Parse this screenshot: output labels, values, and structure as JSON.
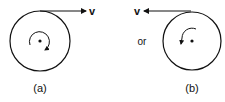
{
  "diagram": {
    "figure_a": {
      "label": "(a)",
      "velocity_label": "v",
      "velocity_direction": "right",
      "rotation": "clockwise"
    },
    "connector": "or",
    "figure_b": {
      "label": "(b)",
      "velocity_label": "v",
      "velocity_direction": "left",
      "rotation": "counterclockwise"
    },
    "colors": {
      "stroke": "#111111",
      "background": "#ffffff"
    }
  }
}
